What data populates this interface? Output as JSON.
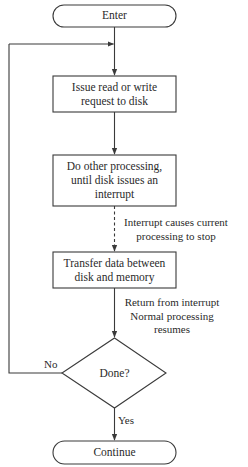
{
  "diagram": {
    "type": "flowchart",
    "nodes": {
      "enter": {
        "shape": "terminal",
        "label": "Enter"
      },
      "issue": {
        "shape": "process",
        "label_lines": [
          "Issue read or write",
          "request to disk"
        ]
      },
      "other": {
        "shape": "process",
        "label_lines": [
          "Do other processing,",
          "until disk issues an",
          "interrupt"
        ]
      },
      "transfer": {
        "shape": "process",
        "label_lines": [
          "Transfer data between",
          "disk and memory"
        ]
      },
      "done": {
        "shape": "decision",
        "label": "Done?"
      },
      "continue": {
        "shape": "terminal",
        "label": "Continue"
      }
    },
    "edge_labels": {
      "interrupt": [
        "Interrupt causes current",
        "processing to stop"
      ],
      "return": [
        "Return from interrupt",
        "Normal processing",
        "resumes"
      ],
      "no": "No",
      "yes": "Yes"
    },
    "edges": [
      {
        "from": "enter",
        "to": "issue",
        "style": "solid"
      },
      {
        "from": "issue",
        "to": "other",
        "style": "solid"
      },
      {
        "from": "other",
        "to": "transfer",
        "style": "dashed",
        "label": "interrupt"
      },
      {
        "from": "transfer",
        "to": "done",
        "style": "solid",
        "label": "return"
      },
      {
        "from": "done",
        "to": "issue",
        "style": "solid",
        "label": "no",
        "route": "loop-left"
      },
      {
        "from": "done",
        "to": "continue",
        "style": "solid",
        "label": "yes"
      }
    ],
    "colors": {
      "stroke": "#3a3a3a",
      "text": "#2a2a2a",
      "background": "#ffffff"
    }
  }
}
